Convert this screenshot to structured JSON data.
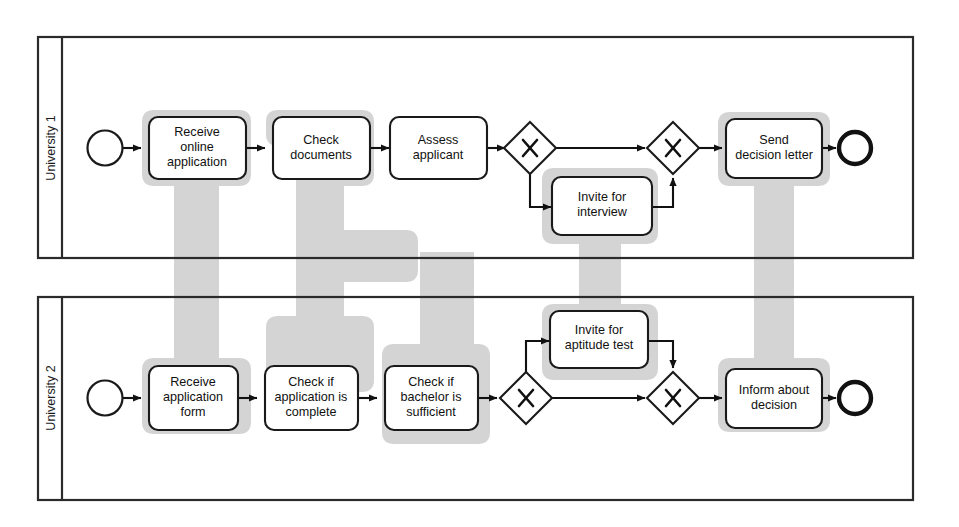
{
  "diagram": {
    "type": "bpmn-process-comparison",
    "colors": {
      "band_highlight": "#d4d4d4",
      "stroke": "#1a1a1a",
      "background": "#ffffff"
    }
  },
  "lanes": [
    {
      "id": "lane1",
      "label": "University 1"
    },
    {
      "id": "lane2",
      "label": "University 2"
    }
  ],
  "lane1": {
    "label": "University 1",
    "start_event": {
      "name": "start-event"
    },
    "end_event": {
      "name": "end-event"
    },
    "tasks": [
      {
        "id": "t1",
        "label": "Receive online application",
        "lines": [
          "Receive",
          "online",
          "application"
        ],
        "highlighted": true
      },
      {
        "id": "t2",
        "label": "Check documents",
        "lines": [
          "Check",
          "documents"
        ],
        "highlighted": true
      },
      {
        "id": "t3",
        "label": "Assess applicant",
        "lines": [
          "Assess",
          "applicant"
        ],
        "highlighted": false
      },
      {
        "id": "t4",
        "label": "Invite for interview",
        "lines": [
          "Invite for",
          "interview"
        ],
        "highlighted": true
      },
      {
        "id": "t5",
        "label": "Send decision letter",
        "lines": [
          "Send",
          "decision letter"
        ],
        "highlighted": true
      }
    ],
    "gateways": [
      {
        "id": "g1",
        "symbol": "X",
        "kind": "exclusive-split"
      },
      {
        "id": "g2",
        "symbol": "X",
        "kind": "exclusive-join"
      }
    ]
  },
  "lane2": {
    "label": "University 2",
    "start_event": {
      "name": "start-event"
    },
    "end_event": {
      "name": "end-event"
    },
    "tasks": [
      {
        "id": "u1",
        "label": "Receive application form",
        "lines": [
          "Receive",
          "application",
          "form"
        ],
        "highlighted": true
      },
      {
        "id": "u2",
        "label": "Check if application is complete",
        "lines": [
          "Check if",
          "application is",
          "complete"
        ],
        "highlighted": true
      },
      {
        "id": "u3",
        "label": "Check if bachelor is sufficient",
        "lines": [
          "Check if",
          "bachelor is",
          "sufficient"
        ],
        "highlighted": true
      },
      {
        "id": "u4",
        "label": "Invite for aptitude test",
        "lines": [
          "Invite for",
          "aptitude test"
        ],
        "highlighted": true
      },
      {
        "id": "u5",
        "label": "Inform about decision",
        "lines": [
          "Inform about",
          "decision"
        ],
        "highlighted": true
      }
    ],
    "gateways": [
      {
        "id": "h1",
        "symbol": "X",
        "kind": "exclusive-split"
      },
      {
        "id": "h2",
        "symbol": "X",
        "kind": "exclusive-join"
      }
    ]
  },
  "correspondences": [
    {
      "from": "t1",
      "to": "u1",
      "label": "Receive online application ↔ Receive application form"
    },
    {
      "from": "t2",
      "to": "u2",
      "label": "Check documents ↔ Check if application is complete"
    },
    {
      "from": "t2",
      "to": "u3",
      "label": "Check documents ↔ Check if bachelor is sufficient"
    },
    {
      "from": "t4",
      "to": "u4",
      "label": "Invite for interview ↔ Invite for aptitude test"
    },
    {
      "from": "t5",
      "to": "u5",
      "label": "Send decision letter ↔ Inform about decision"
    }
  ]
}
